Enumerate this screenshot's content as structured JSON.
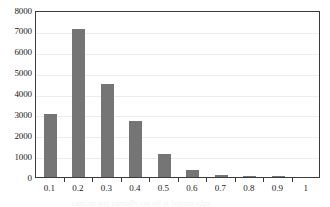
{
  "chart_data": {
    "type": "bar",
    "title": "",
    "subtitle": "",
    "xlabel": "",
    "ylabel": "",
    "categories": [
      "0.1",
      "0.2",
      "0.3",
      "0.4",
      "0.5",
      "0.6",
      "0.7",
      "0.8",
      "0.9",
      "1"
    ],
    "values": [
      3000,
      7100,
      4450,
      2700,
      1100,
      320,
      80,
      30,
      5,
      0
    ],
    "ylim": [
      0,
      8000
    ],
    "y_ticks": [
      0,
      1000,
      2000,
      3000,
      4000,
      5000,
      6000,
      7000,
      8000
    ],
    "y_tick_labels": [
      "0",
      "1000",
      "2000",
      "3000",
      "4000",
      "5000",
      "6000",
      "7000",
      "8000"
    ],
    "grid": "horizontal",
    "legend": "none",
    "series": [
      {
        "name": "frequency",
        "values": [
          3000,
          7100,
          4450,
          2700,
          1100,
          320,
          80,
          30,
          5,
          0
        ]
      }
    ],
    "colors": {
      "bar": "#757575",
      "grid": "#ececec",
      "axis": "#3a3a3a",
      "text": "#1a1a1a",
      "background": "#ffffff"
    }
  },
  "caption": {
    "text": "caption text partially cut off at bottom edge"
  }
}
